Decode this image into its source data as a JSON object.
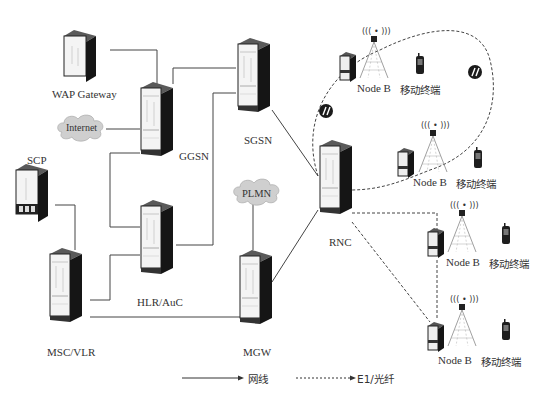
{
  "caption": "",
  "nodes": {
    "wap": "WAP Gateway",
    "internet": "Internet",
    "scp": "SCP",
    "ggsn": "GGSN",
    "sgsn": "SGSN",
    "plmn": "PLMN",
    "hlr": "HLR/AuC",
    "msc": "MSC/VLR",
    "mgw": "MGW",
    "rnc": "RNC"
  },
  "node_b_sites": [
    {
      "node_label": "Node B",
      "terminal_label": "移动终端"
    },
    {
      "node_label": "Node B",
      "terminal_label": "移动终端"
    },
    {
      "node_label": "Node B",
      "terminal_label": "移动终端"
    },
    {
      "node_label": "Node B",
      "terminal_label": "移动终端"
    }
  ],
  "legend": {
    "solid": "网线",
    "dashed": "E1/光纤"
  },
  "colors": {
    "rack_dark": "#1a1a1a",
    "rack_top": "#555555",
    "rack_face": "#f2f2f2",
    "cloud": "#c8c8c8",
    "line": "#444444"
  }
}
